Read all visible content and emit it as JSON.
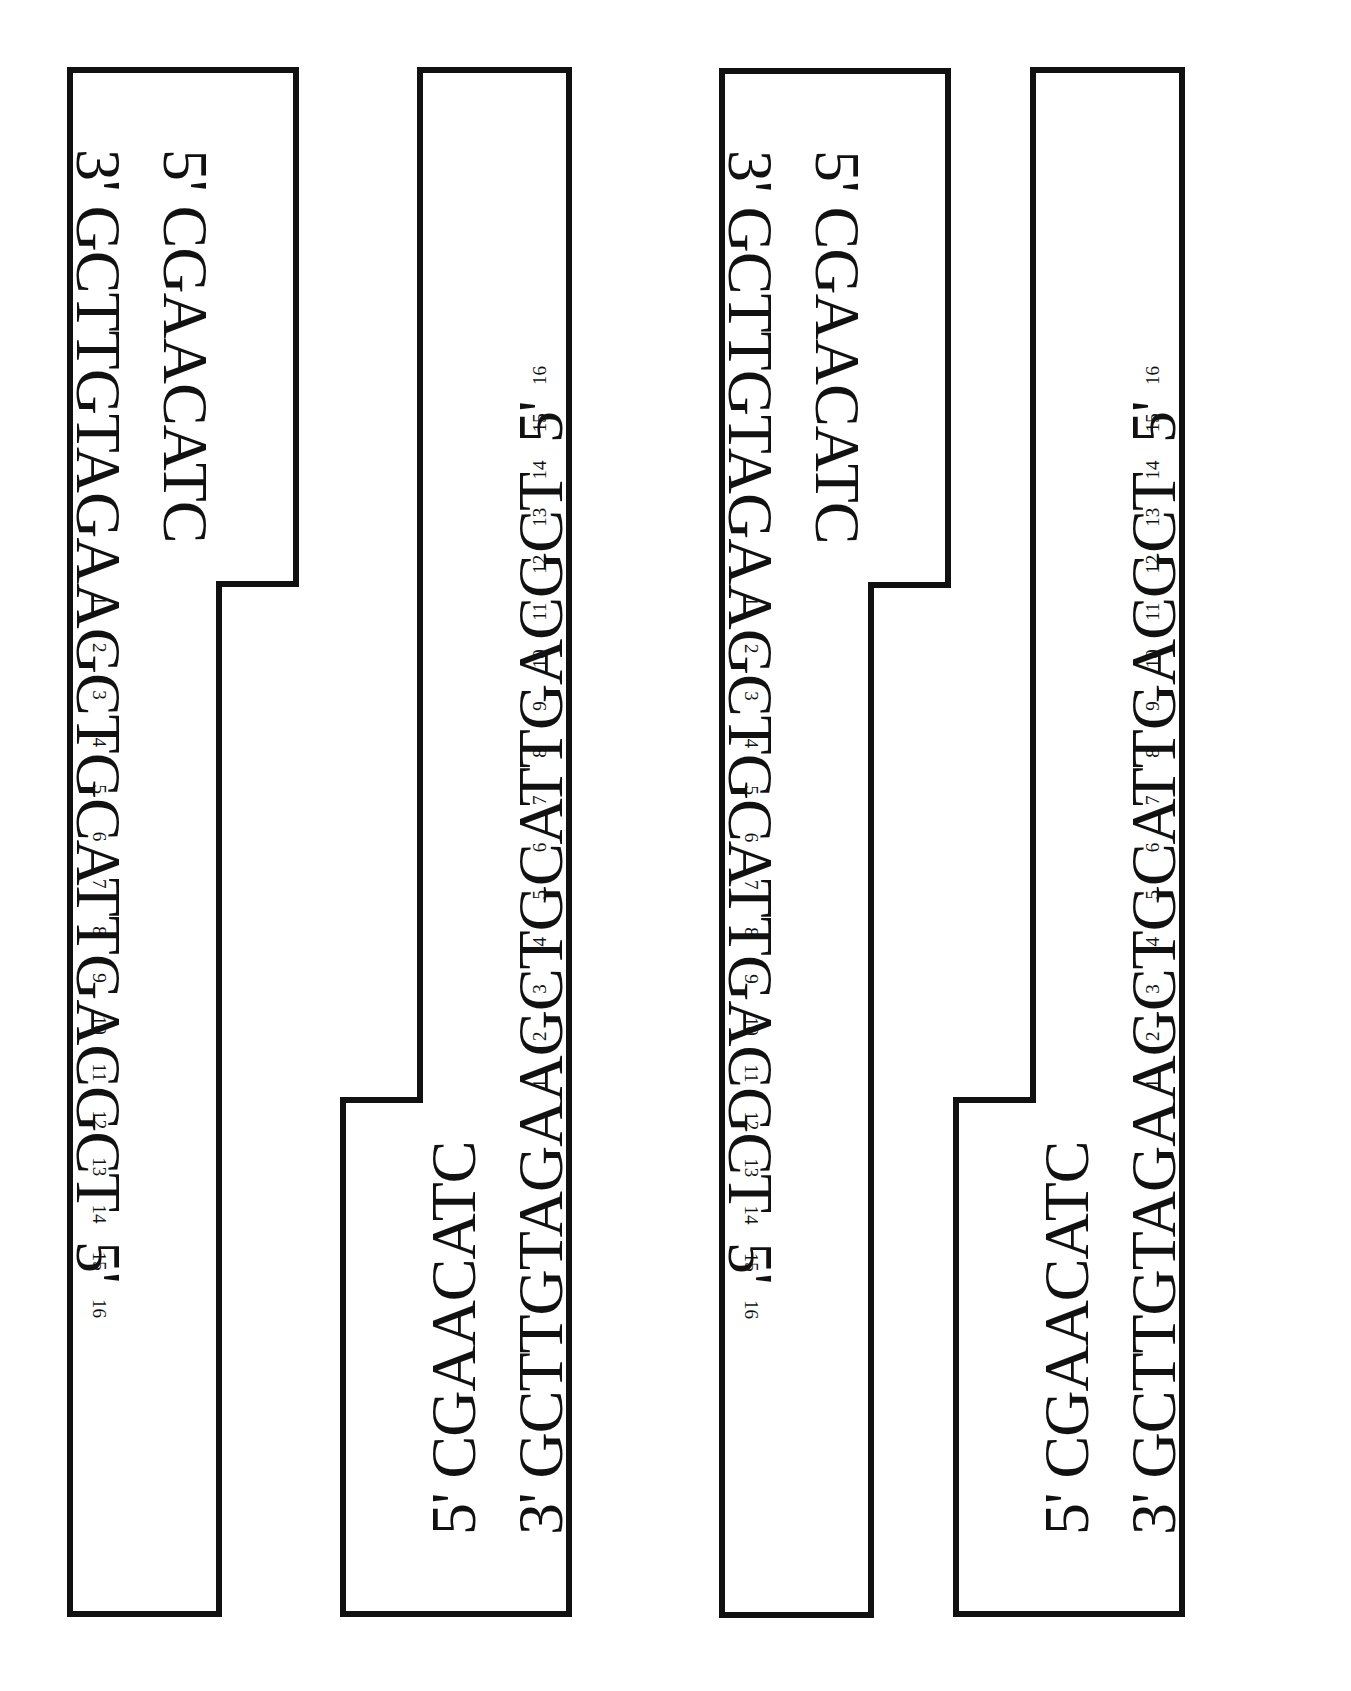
{
  "strips": [
    {
      "top_strand_label": "5'",
      "top_strand_seq": "CGAACATC",
      "bottom_strand_label": "3'",
      "bottom_strand_seq": "GCTTGTAGAAGCTGCATTGACGCT",
      "bottom_strand_end_label": "5'",
      "numbers": [
        "1",
        "2",
        "3",
        "4",
        "5",
        "6",
        "7",
        "8",
        "9",
        "10",
        "11",
        "12",
        "13",
        "14",
        "15",
        "16"
      ],
      "orientation": "clockwise"
    },
    {
      "top_strand_label": "5'",
      "top_strand_seq": "CGAACATC",
      "bottom_strand_label": "3'",
      "bottom_strand_seq": "GCTTGTAGAAGCTGCATTGACGCT",
      "bottom_strand_end_label": "5'",
      "numbers": [
        "1",
        "2",
        "3",
        "4",
        "5",
        "6",
        "7",
        "8",
        "9",
        "10",
        "11",
        "12",
        "13",
        "14",
        "15",
        "16"
      ],
      "orientation": "counter-clockwise"
    },
    {
      "top_strand_label": "5'",
      "top_strand_seq": "CGAACATC",
      "bottom_strand_label": "3'",
      "bottom_strand_seq": "GCTTGTAGAAGCTGCATTGACGCT",
      "bottom_strand_end_label": "5'",
      "numbers": [
        "1",
        "2",
        "3",
        "4",
        "5",
        "6",
        "7",
        "8",
        "9",
        "10",
        "11",
        "12",
        "13",
        "14",
        "15",
        "16"
      ],
      "orientation": "clockwise"
    },
    {
      "top_strand_label": "5'",
      "top_strand_seq": "CGAACATC",
      "bottom_strand_label": "3'",
      "bottom_strand_seq": "GCTTGTAGAAGCTGCATTGACGCT",
      "bottom_strand_end_label": "5'",
      "numbers": [
        "1",
        "2",
        "3",
        "4",
        "5",
        "6",
        "7",
        "8",
        "9",
        "10",
        "11",
        "12",
        "13",
        "14",
        "15",
        "16"
      ],
      "orientation": "counter-clockwise"
    }
  ]
}
